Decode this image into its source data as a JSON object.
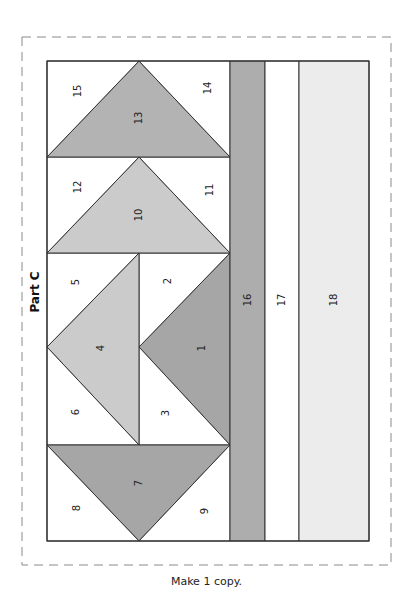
{
  "part_title": "Part C",
  "caption": "Make 1 copy.",
  "colors": {
    "outline": "#333333",
    "dashed_border": "#8a8a8a",
    "white": "#ffffff",
    "light_gray": "#cbcbcb",
    "medium_gray": "#b3b3b3",
    "dark_gray": "#a6a6a6",
    "strip_gray": "#adadad",
    "pale_gray": "#ececec"
  },
  "pieces": [
    {
      "id": "1",
      "label": "1",
      "shape": "triangle",
      "fill": "dark_gray"
    },
    {
      "id": "2",
      "label": "2",
      "shape": "triangle",
      "fill": "white"
    },
    {
      "id": "3",
      "label": "3",
      "shape": "triangle",
      "fill": "white"
    },
    {
      "id": "4",
      "label": "4",
      "shape": "triangle",
      "fill": "light_gray"
    },
    {
      "id": "5",
      "label": "5",
      "shape": "triangle",
      "fill": "white"
    },
    {
      "id": "6",
      "label": "6",
      "shape": "triangle",
      "fill": "white"
    },
    {
      "id": "7",
      "label": "7",
      "shape": "triangle",
      "fill": "dark_gray"
    },
    {
      "id": "8",
      "label": "8",
      "shape": "triangle",
      "fill": "white"
    },
    {
      "id": "9",
      "label": "9",
      "shape": "triangle",
      "fill": "white"
    },
    {
      "id": "10",
      "label": "10",
      "shape": "triangle",
      "fill": "light_gray"
    },
    {
      "id": "11",
      "label": "11",
      "shape": "triangle",
      "fill": "white"
    },
    {
      "id": "12",
      "label": "12",
      "shape": "triangle",
      "fill": "white"
    },
    {
      "id": "13",
      "label": "13",
      "shape": "triangle",
      "fill": "medium_gray"
    },
    {
      "id": "14",
      "label": "14",
      "shape": "triangle",
      "fill": "white"
    },
    {
      "id": "15",
      "label": "15",
      "shape": "triangle",
      "fill": "white"
    },
    {
      "id": "16",
      "label": "16",
      "shape": "strip",
      "fill": "strip_gray"
    },
    {
      "id": "17",
      "label": "17",
      "shape": "strip",
      "fill": "white"
    },
    {
      "id": "18",
      "label": "18",
      "shape": "strip",
      "fill": "pale_gray"
    }
  ]
}
